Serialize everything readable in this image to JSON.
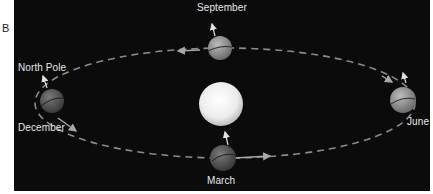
{
  "figure": {
    "panel_label": "B",
    "background_color": "#0b0b0b",
    "orbit_color": "#8a8a8a",
    "sun_color": "#f4f4f4",
    "labels": {
      "north_pole": "North Pole",
      "september": "September",
      "december": "December",
      "june": "June",
      "march": "March"
    },
    "earth_positions": [
      {
        "month": "September",
        "position": "top"
      },
      {
        "month": "December",
        "position": "left"
      },
      {
        "month": "June",
        "position": "right"
      },
      {
        "month": "March",
        "position": "bottom"
      }
    ],
    "center_body": "Sun"
  }
}
